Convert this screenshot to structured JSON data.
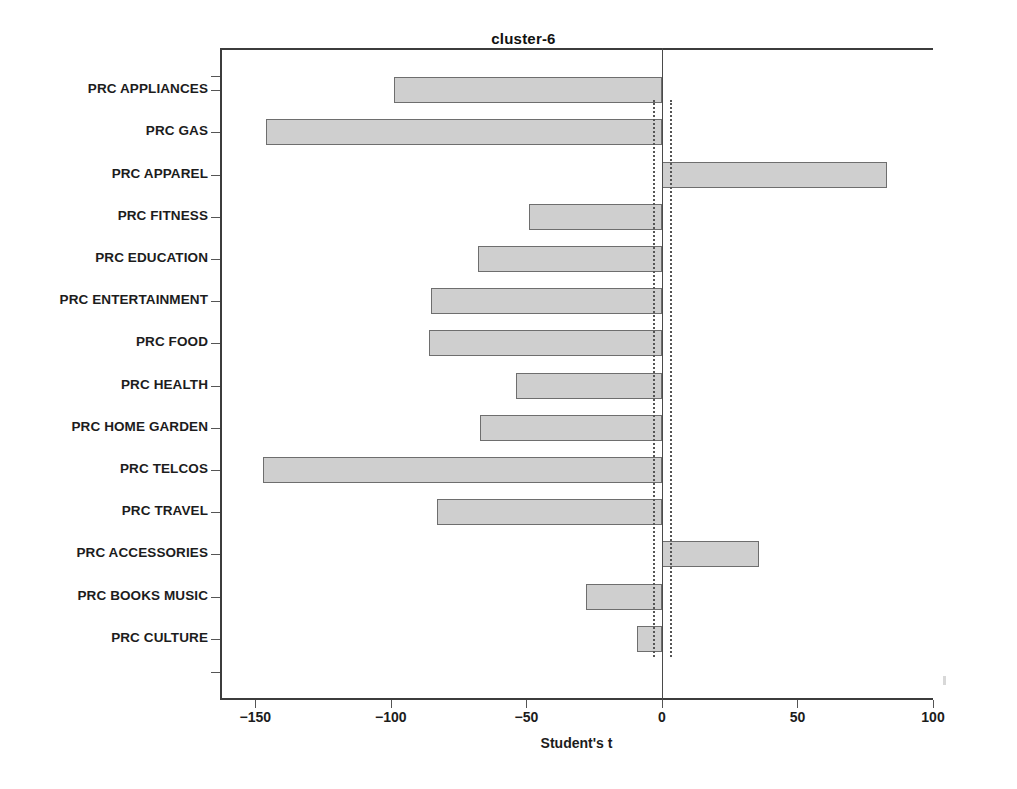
{
  "chart_data": {
    "type": "bar",
    "orientation": "horizontal",
    "title": "cluster-6",
    "xlabel": "Student's t",
    "ylabel": "",
    "xlim": [
      -163,
      100
    ],
    "xticks": [
      -150,
      -100,
      -50,
      0,
      50,
      100
    ],
    "xticklabels": [
      "-150",
      "-100",
      "-50",
      "0",
      "50",
      "100"
    ],
    "grid": false,
    "legend": null,
    "reference_lines": [
      {
        "name": "significance-negative",
        "value": -3.2,
        "style": "dotted"
      },
      {
        "name": "significance-positive",
        "value": 2.9,
        "style": "dotted"
      },
      {
        "name": "zero-axis",
        "value": 0,
        "style": "solid"
      }
    ],
    "categories": [
      "PRC APPLIANCES",
      "PRC GAS",
      "PRC APPAREL",
      "PRC FITNESS",
      "PRC EDUCATION",
      "PRC ENTERTAINMENT",
      "PRC FOOD",
      "PRC HEALTH",
      "PRC HOME GARDEN",
      "PRC TELCOS",
      "PRC TRAVEL",
      "PRC ACCESSORIES",
      "PRC BOOKS MUSIC",
      "PRC CULTURE"
    ],
    "values": [
      -99,
      -146,
      83,
      -49,
      -68,
      -85,
      -86,
      -54,
      -67,
      -147,
      -83,
      36,
      -28,
      -9
    ],
    "bar_fill_color": "#cfcfcf",
    "bar_border_color": "#6e6e6e"
  },
  "axes": {
    "y_tick_labels": [
      "PRC APPLIANCES",
      "PRC GAS",
      "PRC APPAREL",
      "PRC FITNESS",
      "PRC EDUCATION",
      "PRC ENTERTAINMENT",
      "PRC FOOD",
      "PRC HEALTH",
      "PRC HOME GARDEN",
      "PRC TELCOS",
      "PRC TRAVEL",
      "PRC ACCESSORIES",
      "PRC BOOKS MUSIC",
      "PRC CULTURE"
    ],
    "x_tick_labels": [
      "-150",
      "-100",
      "-50",
      "0",
      "50",
      "100"
    ]
  },
  "title": "cluster-6",
  "xaxis_title": "Student's t"
}
